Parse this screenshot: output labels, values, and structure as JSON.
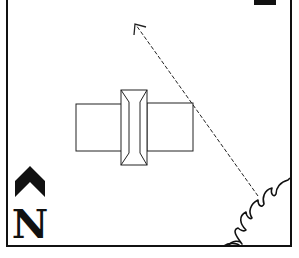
{
  "diagram": {
    "type": "site-plan",
    "background": "#ffffff",
    "stroke_color": "#111111",
    "frame": {
      "x": 7,
      "y": -4,
      "width": 284,
      "height": 250
    },
    "building": {
      "left_wing": {
        "x": 76,
        "y": 104,
        "width": 46,
        "height": 47
      },
      "center_block": {
        "x": 121,
        "y": 90,
        "width": 26,
        "height": 75
      },
      "ridge": {
        "x1": 129,
        "x2": 140,
        "y_top": 102,
        "y_bottom": 153
      },
      "right_wing": {
        "x": 147,
        "y": 103,
        "width": 46,
        "height": 48
      }
    },
    "direction_arrow": {
      "style": "dashed",
      "from": {
        "x": 258,
        "y": 196
      },
      "to": {
        "x": 135,
        "y": 24
      }
    },
    "north_arrow": {
      "label": "N",
      "chevron_icon": "chevron-up-icon"
    },
    "vegetation": {
      "icon": "shrub-icon",
      "position": "bottom-right"
    },
    "corner_fragment": {
      "position": "top-right",
      "description": "partial dark glyph"
    }
  }
}
